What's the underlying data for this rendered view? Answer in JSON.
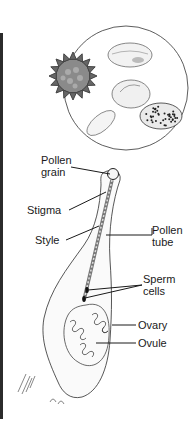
{
  "figure": {
    "inset": "Magnified pollen grains of various shapes",
    "labels": {
      "pollen_grain": [
        "Pollen",
        "grain"
      ],
      "stigma": "Stigma",
      "style": "Style",
      "pollen_tube": [
        "Pollen",
        "tube"
      ],
      "sperm_cells": [
        "Sperm",
        "cells"
      ],
      "ovary": "Ovary",
      "ovule": "Ovule"
    },
    "colors": {
      "line": "#1a1a1a",
      "border_bar": "#2b2b2b",
      "background": "#ffffff"
    }
  }
}
